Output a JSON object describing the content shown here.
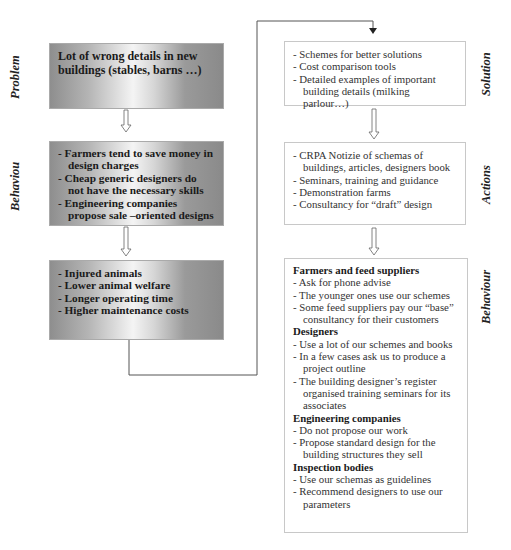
{
  "left_column": {
    "problem": {
      "label": "Problem",
      "lines": [
        "Lot of wrong details in new",
        "buildings (stables, barns …)"
      ]
    },
    "behaviour": {
      "label": "Behaviou",
      "items": [
        "- Farmers tend to save money in design charges",
        "- Cheap generic designers do not have the necessary skills",
        "- Engineering companies propose sale –oriented designs"
      ]
    },
    "consequences": {
      "items": [
        "- Injured animals",
        "- Lower animal welfare",
        "- Longer operating time",
        "- Higher maintenance costs"
      ]
    }
  },
  "right_column": {
    "solution": {
      "label": "Solution",
      "items": [
        "- Schemes for better solutions",
        "- Cost comparison tools",
        "- Detailed examples of important building details (milking parlour…)"
      ]
    },
    "actions": {
      "label": "Actions",
      "items": [
        "- CRPA Notizie of schemas of buildings, articles, designers book",
        "- Seminars, training and guidance",
        "- Demonstration farms",
        "- Consultancy for “draft” design"
      ]
    },
    "behaviour": {
      "label": "Behaviour",
      "groups": [
        {
          "heading": "Farmers and feed suppliers",
          "items": [
            "- Ask for phone advise",
            "- The younger ones use our schemes",
            "- Some feed suppliers pay our “base” consultancy for their customers"
          ]
        },
        {
          "heading": "Designers",
          "items": [
            "- Use a lot of our schemes and books",
            "- In a few cases ask us to produce a project outline",
            "- The building designer’s register organised training seminars for its associates"
          ]
        },
        {
          "heading": "Engineering companies",
          "items": [
            "- Do not propose our work",
            "- Propose standard design for the building structures they sell"
          ]
        },
        {
          "heading": "Inspection bodies",
          "items": [
            "- Use our schemas as guidelines",
            "- Recommend designers to use our parameters"
          ]
        }
      ]
    }
  },
  "colors": {
    "connector": "#555555",
    "box_border": "#c8c8c8",
    "gradient_dark": "#8e8e8e",
    "gradient_light": "#f4f4f4"
  }
}
